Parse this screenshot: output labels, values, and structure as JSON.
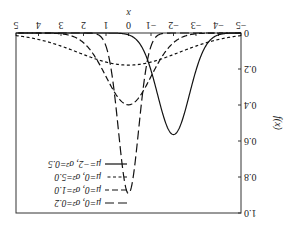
{
  "chart_data": {
    "type": "line",
    "title": "",
    "xlabel": "x",
    "ylabel": "f(x)",
    "xlim": [
      -5,
      5
    ],
    "ylim": [
      0,
      1.0
    ],
    "xticks": [
      -5,
      -4,
      -3,
      -2,
      -1,
      0,
      1,
      2,
      3,
      4,
      5
    ],
    "xtick_labels": [
      "−5",
      "−4",
      "−3",
      "−2",
      "−1",
      "0",
      "1",
      "2",
      "3",
      "4",
      "5"
    ],
    "yticks": [
      0,
      0.2,
      0.4,
      0.6,
      0.8,
      1.0
    ],
    "ytick_labels": [
      "0",
      "0.2",
      "0.4",
      "0.6",
      "0.8",
      "1.0"
    ],
    "grid": false,
    "legend_position": "upper right",
    "orientation_note": "rendered rotated 180 degrees",
    "series": [
      {
        "name": "μ=0, σ²=0.2",
        "mu": 0,
        "sigma2": 0.2,
        "style": "long-dash",
        "peak": 0.89
      },
      {
        "name": "μ=0, σ²=1.0",
        "mu": 0,
        "sigma2": 1.0,
        "style": "dash",
        "peak": 0.4
      },
      {
        "name": "μ=0, σ²=5.0",
        "mu": 0,
        "sigma2": 5.0,
        "style": "short-dash",
        "peak": 0.18
      },
      {
        "name": "μ=−2, σ²=0.5",
        "mu": -2,
        "sigma2": 0.5,
        "style": "solid",
        "peak": 0.56
      }
    ]
  },
  "labels": {
    "x_axis": "x",
    "y_axis": "f(x)",
    "legend": [
      "μ=0, σ²=0.2",
      "μ=0, σ²=1.0",
      "μ=0, σ²=5.0",
      "μ=−2, σ²=0.5"
    ]
  }
}
